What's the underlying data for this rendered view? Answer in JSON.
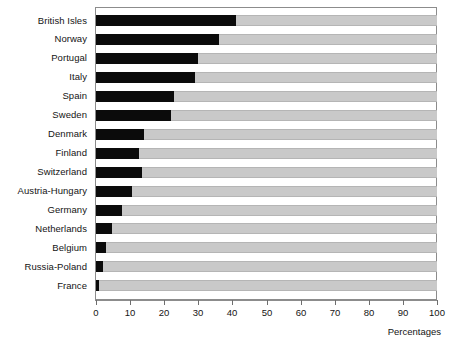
{
  "chart_data": {
    "type": "bar",
    "orientation": "horizontal",
    "stacked": true,
    "title": "",
    "subtitle": "",
    "xlabel": "Percentages",
    "ylabel": "",
    "xlim": [
      0,
      100
    ],
    "xticks": [
      0,
      10,
      20,
      30,
      40,
      50,
      60,
      70,
      80,
      90,
      100
    ],
    "xticklabels": [
      "0",
      "10",
      "20",
      "30",
      "40",
      "50",
      "60",
      "70",
      "80",
      "90",
      "100"
    ],
    "grid": false,
    "legend": null,
    "categories": [
      "British Isles",
      "Norway",
      "Portugal",
      "Italy",
      "Spain",
      "Sweden",
      "Denmark",
      "Finland",
      "Switzerland",
      "Austria-Hungary",
      "Germany",
      "Netherlands",
      "Belgium",
      "Russia-Poland",
      "France"
    ],
    "series": [
      {
        "name": "filled",
        "color": "#0b0b0b",
        "values": [
          41,
          36,
          30,
          29,
          23,
          22,
          14,
          12.5,
          13.5,
          10.5,
          7.7,
          4.6,
          2.9,
          2.0,
          1.0
        ]
      },
      {
        "name": "remainder",
        "color": "#c9c9c9",
        "values": [
          59,
          64,
          70,
          71,
          77,
          78,
          86,
          87.5,
          86.5,
          89.5,
          92.3,
          95.4,
          97.1,
          98.0,
          99.0
        ]
      }
    ]
  },
  "colors": {
    "filled": "#0b0b0b",
    "remainder": "#c9c9c9",
    "frame": "#8c8c8c",
    "text": "#141414",
    "background": "#ffffff"
  }
}
